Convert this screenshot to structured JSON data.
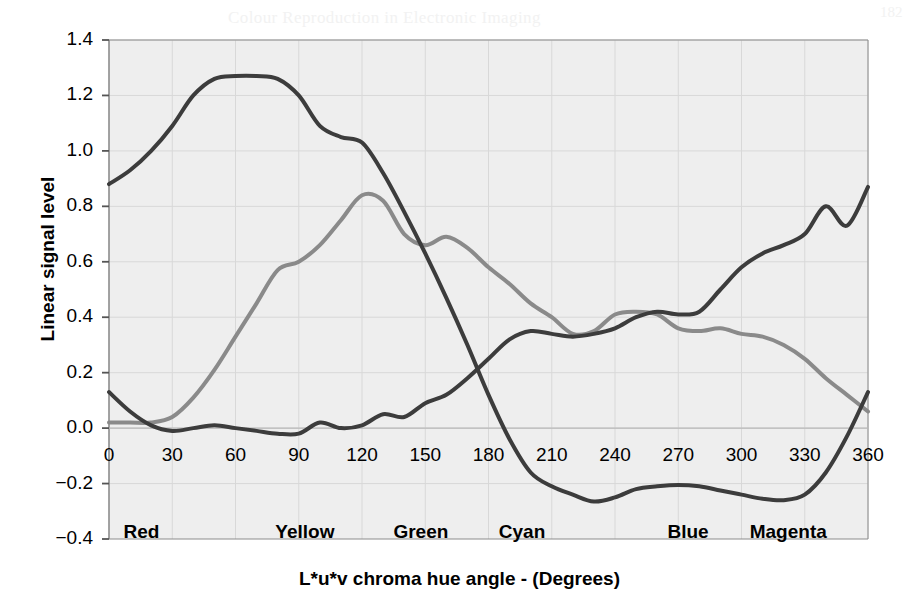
{
  "figure": {
    "background_color": "#ffffff",
    "plot_background_color": "#eeeeee",
    "grid_color": "#d8d8d8",
    "axis_color": "#8c8c8c",
    "bleed_through_text": [
      "Colour Reproduction in Electronic Imaging",
      "Figure 9.8(b) is a transformation of Fig 9.7(a)",
      "and the calculated values here are not identical to",
      "those shown in 9.8(a) because the those involved in",
      "cases of chroma values, that the two sets of",
      "the results.",
      "",
      "The results shown in 9.8(b) are not directly comparable",
      "since the data of Figure 9.8(a) was recorded from a",
      "camera that was adjusted for the three channels",
      "",
      "as a measure of the relative response of the signal",
      "levels in the three channels of a camera.",
      "182"
    ]
  },
  "chart_data": {
    "type": "line",
    "title": "",
    "xlabel": "L*u*v chroma hue angle - (Degrees)",
    "ylabel": "Linear signal level",
    "xlim": [
      0,
      360
    ],
    "ylim": [
      -0.4,
      1.4
    ],
    "xticks": [
      0,
      30,
      60,
      90,
      120,
      150,
      180,
      210,
      240,
      270,
      300,
      330,
      360
    ],
    "xtick_labels": [
      "0",
      "30",
      "60",
      "90",
      "120",
      "150",
      "180",
      "210",
      "240",
      "270",
      "300",
      "330",
      "360"
    ],
    "yticks": [
      -0.4,
      -0.2,
      0.0,
      0.2,
      0.4,
      0.6,
      0.8,
      1.0,
      1.2,
      1.4
    ],
    "ytick_labels": [
      "-0.4",
      "-0.2",
      "0.0",
      "0.2",
      "0.4",
      "0.6",
      "0.8",
      "1.0",
      "1.2",
      "1.4"
    ],
    "grid": true,
    "legend": "none",
    "hue_annotations": [
      {
        "label": "Red",
        "angle": 5
      },
      {
        "label": "Yellow",
        "angle": 77
      },
      {
        "label": "Green",
        "angle": 133
      },
      {
        "label": "Cyan",
        "angle": 183
      },
      {
        "label": "Blue",
        "angle": 263
      },
      {
        "label": "Magenta",
        "angle": 302
      }
    ],
    "x": [
      0,
      10,
      20,
      30,
      40,
      50,
      60,
      70,
      80,
      90,
      100,
      110,
      120,
      130,
      140,
      150,
      160,
      170,
      180,
      190,
      200,
      210,
      220,
      230,
      240,
      250,
      260,
      270,
      280,
      290,
      300,
      310,
      320,
      330,
      340,
      350,
      360
    ],
    "series": [
      {
        "name": "Red channel",
        "color": "#3c3c3c",
        "width": 4,
        "values": [
          0.88,
          0.93,
          1.0,
          1.09,
          1.2,
          1.26,
          1.27,
          1.27,
          1.26,
          1.2,
          1.09,
          1.05,
          1.03,
          0.92,
          0.78,
          0.63,
          0.47,
          0.3,
          0.12,
          -0.04,
          -0.16,
          -0.21,
          -0.24,
          -0.265,
          -0.25,
          -0.22,
          -0.21,
          -0.205,
          -0.21,
          -0.225,
          -0.24,
          -0.255,
          -0.26,
          -0.24,
          -0.16,
          -0.03,
          0.13
        ]
      },
      {
        "name": "Green channel",
        "color": "#8a8a8a",
        "width": 4,
        "values": [
          0.02,
          0.02,
          0.02,
          0.04,
          0.11,
          0.21,
          0.33,
          0.45,
          0.57,
          0.6,
          0.66,
          0.75,
          0.84,
          0.82,
          0.7,
          0.66,
          0.69,
          0.65,
          0.58,
          0.52,
          0.45,
          0.4,
          0.34,
          0.35,
          0.41,
          0.42,
          0.41,
          0.36,
          0.35,
          0.36,
          0.34,
          0.33,
          0.3,
          0.25,
          0.18,
          0.12,
          0.06
        ]
      },
      {
        "name": "Blue channel",
        "color": "#3c3c3c",
        "width": 4,
        "values": [
          0.13,
          0.06,
          0.01,
          -0.01,
          0.0,
          0.01,
          0.0,
          -0.01,
          -0.02,
          -0.02,
          0.02,
          0.0,
          0.01,
          0.05,
          0.04,
          0.09,
          0.12,
          0.18,
          0.25,
          0.32,
          0.35,
          0.34,
          0.33,
          0.34,
          0.36,
          0.4,
          0.42,
          0.41,
          0.42,
          0.5,
          0.58,
          0.63,
          0.66,
          0.7,
          0.8,
          0.73,
          0.87
        ]
      }
    ],
    "series_plot_order": [
      "Green channel",
      "Blue channel",
      "Red channel"
    ]
  },
  "axis": {
    "plot_left_px": 109,
    "plot_right_px": 868,
    "plot_top_px": 40,
    "plot_bottom_px": 539
  }
}
